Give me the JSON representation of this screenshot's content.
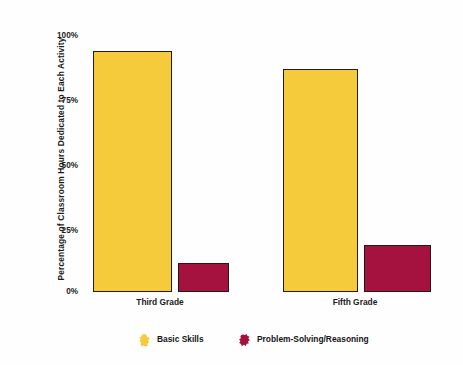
{
  "chart_data": {
    "type": "bar",
    "title": "",
    "subtitle": "",
    "xlabel": "",
    "ylabel": "Percentage of Classroom Hours Dedicated to Each Activity",
    "categories": [
      "Third Grade",
      "Fifth Grade"
    ],
    "series": [
      {
        "name": "Basic Skills",
        "color": "#F5CB3C",
        "values": [
          92,
          85
        ]
      },
      {
        "name": "Problem-Solving/Reasoning",
        "color": "#A5123F",
        "values": [
          11,
          18
        ]
      }
    ],
    "ylim": [
      0,
      100
    ],
    "yticks": [
      0,
      25,
      50,
      75,
      100
    ],
    "ytick_labels": [
      "0%",
      "25%",
      "50%",
      "75%",
      "100%"
    ],
    "grid": false,
    "legend_position": "bottom",
    "annotations": []
  },
  "legend": {
    "items": [
      {
        "label": "Basic Skills",
        "swatch": "legend-swatch-basic-skills"
      },
      {
        "label": "Problem-Solving/Reasoning",
        "swatch": "legend-swatch-problem-solving"
      }
    ]
  },
  "colors": {
    "basic_skills": "#F5CB3C",
    "problem_solving": "#A5123F",
    "bar_outline": "#241A10",
    "text": "#1B1B1B",
    "background": "#FEFEFE"
  }
}
